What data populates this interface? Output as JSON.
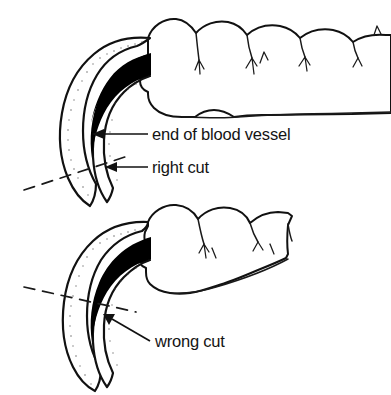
{
  "figure": {
    "background_color": "#ffffff",
    "ink_color": "#111111",
    "quick_color": "#000000"
  },
  "labels": {
    "blood_vessel": "end of blood vessel",
    "right_cut": "right cut",
    "wrong_cut": "wrong cut"
  },
  "panels": [
    {
      "name": "upper-claw-correct",
      "cut_type": "right cut",
      "description": "claw with dashed cut line beyond the end of the blood vessel"
    },
    {
      "name": "lower-claw-incorrect",
      "cut_type": "wrong cut",
      "description": "claw with dashed cut line through the blood vessel"
    }
  ],
  "annotations": [
    {
      "name": "end-of-blood-vessel",
      "label": "end of blood vessel",
      "target": "upper-claw-quick-tip"
    },
    {
      "name": "right-cut",
      "label": "right cut",
      "target": "upper-claw-cut-line"
    },
    {
      "name": "wrong-cut",
      "label": "wrong cut",
      "target": "lower-claw-cut-line"
    }
  ]
}
